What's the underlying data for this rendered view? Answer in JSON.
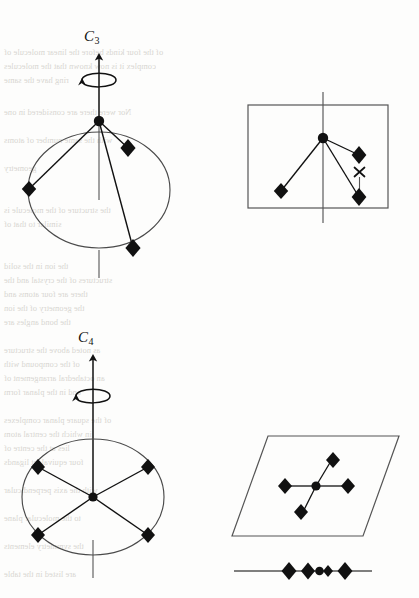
{
  "figure": {
    "kind": "chemistry-symmetry-diagram",
    "ink_color": "#111111",
    "line_color": "#3a3a3a",
    "bleed_color": "#b9b5ae",
    "background": "#fdfdfc",
    "width": 419,
    "height": 598
  },
  "panels": {
    "top_left": {
      "name": "c3-axis-perspective",
      "axis_label": "C",
      "axis_order": "3",
      "description": "Trigonal pyramidal molecule with C3 rotation axis through apex atom and centre of a circle bearing three ligand atoms",
      "central_atom": "circle",
      "ligand_marker": "diamond",
      "ligand_count": 3,
      "has_rotation_arrow": true,
      "has_circle_outline": true
    },
    "top_right": {
      "name": "c3-projection-box",
      "description": "Boxed projection of the trigonal pyramidal molecule with a vertical mirror line; an x marks a projected position",
      "central_atom": "circle",
      "ligand_marker": "diamond",
      "ligand_count": 3,
      "mark": "x",
      "has_box": true,
      "has_vertical_line": true
    },
    "bottom_left": {
      "name": "c4-axis-perspective",
      "axis_label": "C",
      "axis_order": "4",
      "description": "Square planar molecule with C4 rotation axis perpendicular to the plane of four ligand atoms drawn inside a circle",
      "central_atom": "dot",
      "ligand_marker": "diamond",
      "ligand_count": 4,
      "has_rotation_arrow": true,
      "has_circle_outline": true
    },
    "bottom_right_plane": {
      "name": "c4-projection-parallelogram",
      "description": "Parallelogram showing the square planar molecule viewed obliquely, four ligand diamonds around a central atom",
      "central_atom": "dot",
      "ligand_marker": "diamond",
      "ligand_count": 4,
      "has_parallelogram": true
    },
    "bottom_right_edge": {
      "name": "c4-edge-on-view",
      "description": "Edge-on view of the square planar molecule: ligand diamonds collapsed onto a single horizontal line through the central atom",
      "central_atom": "dot",
      "ligand_marker": "diamond",
      "ligand_count": 4,
      "has_horizontal_line": true
    }
  },
  "labels": {
    "c3": {
      "letter": "C",
      "order": "3"
    },
    "c4": {
      "letter": "C",
      "order": "4"
    }
  },
  "bleed_text": {
    "note": "faint mirrored show-through text from the reverse side of the scanned page",
    "lines": [
      {
        "text": "of the four kinds before the linear molecule of",
        "x": 4,
        "y": 48
      },
      {
        "text": "complex it is now known that the molecules",
        "x": 4,
        "y": 62
      },
      {
        "text": "ring have the same",
        "x": 4,
        "y": 76
      },
      {
        "text": "Nor were there are considered in one",
        "x": 4,
        "y": 108
      },
      {
        "text": "with the same number of atoms",
        "x": 4,
        "y": 136
      },
      {
        "text": "geometry",
        "x": 4,
        "y": 164
      },
      {
        "text": "the structure of the molecule is",
        "x": 4,
        "y": 206
      },
      {
        "text": "similar to that of",
        "x": 4,
        "y": 220
      },
      {
        "text": "the ion in the solid",
        "x": 4,
        "y": 262
      },
      {
        "text": "structures of the crystal and the",
        "x": 4,
        "y": 276
      },
      {
        "text": "there are four atoms and",
        "x": 4,
        "y": 290
      },
      {
        "text": "the geometry of the ion",
        "x": 4,
        "y": 304
      },
      {
        "text": "the bond angles are",
        "x": 4,
        "y": 318
      },
      {
        "text": "as noted above the structure",
        "x": 4,
        "y": 346
      },
      {
        "text": "of the compound with",
        "x": 4,
        "y": 360
      },
      {
        "text": "an octahedral arrangement of",
        "x": 4,
        "y": 374
      },
      {
        "text": "and in the planar form",
        "x": 4,
        "y": 388
      },
      {
        "text": "of the square planar complexes",
        "x": 4,
        "y": 416
      },
      {
        "text": "in which the central atom",
        "x": 4,
        "y": 430
      },
      {
        "text": "lies at the centre of",
        "x": 4,
        "y": 444
      },
      {
        "text": "four equivalent ligands",
        "x": 4,
        "y": 458
      },
      {
        "text": "with the axis perpendicular",
        "x": 4,
        "y": 486
      },
      {
        "text": "to the molecular plane",
        "x": 4,
        "y": 514
      },
      {
        "text": "the symmetry elements",
        "x": 4,
        "y": 542
      },
      {
        "text": "are listed in the table",
        "x": 4,
        "y": 570
      }
    ]
  }
}
